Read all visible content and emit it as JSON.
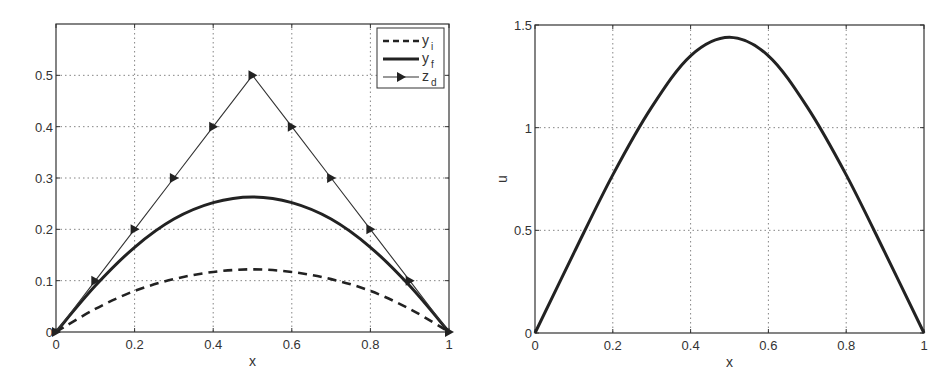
{
  "chart_data": [
    {
      "type": "line",
      "title": "",
      "xlabel": "x",
      "ylabel": "",
      "xlim": [
        0,
        1
      ],
      "ylim": [
        0,
        0.6
      ],
      "xticks": [
        "0",
        "0.2",
        "0.4",
        "0.6",
        "0.8",
        "1"
      ],
      "yticks": [
        "0",
        "0.1",
        "0.2",
        "0.3",
        "0.4",
        "0.5"
      ],
      "grid": true,
      "legend_position": "upper right",
      "series": [
        {
          "name": "y_i",
          "legend_label": "y",
          "legend_sub": "i",
          "style": "dashed",
          "x": [
            0,
            0.1,
            0.2,
            0.3,
            0.4,
            0.5,
            0.6,
            0.7,
            0.8,
            0.9,
            1.0
          ],
          "values": [
            0,
            0.045,
            0.08,
            0.103,
            0.117,
            0.122,
            0.117,
            0.103,
            0.08,
            0.045,
            0
          ]
        },
        {
          "name": "y_f",
          "legend_label": "y",
          "legend_sub": "f",
          "style": "solid-thick",
          "x": [
            0,
            0.1,
            0.2,
            0.3,
            0.4,
            0.5,
            0.6,
            0.7,
            0.8,
            0.9,
            1.0
          ],
          "values": [
            0,
            0.09,
            0.165,
            0.22,
            0.252,
            0.263,
            0.252,
            0.22,
            0.165,
            0.09,
            0
          ]
        },
        {
          "name": "z_d",
          "legend_label": "z",
          "legend_sub": "d",
          "style": "thin-with-triangle-markers",
          "x": [
            0,
            0.1,
            0.2,
            0.3,
            0.4,
            0.5,
            0.6,
            0.7,
            0.8,
            0.9,
            1.0
          ],
          "values": [
            0,
            0.1,
            0.2,
            0.3,
            0.4,
            0.5,
            0.4,
            0.3,
            0.2,
            0.1,
            0
          ]
        }
      ]
    },
    {
      "type": "line",
      "title": "",
      "xlabel": "x",
      "ylabel": "u",
      "xlim": [
        0,
        1
      ],
      "ylim": [
        0,
        1.5
      ],
      "xticks": [
        "0",
        "0.2",
        "0.4",
        "0.6",
        "0.8",
        "1"
      ],
      "yticks": [
        "0",
        "0.5",
        "1",
        "1.5"
      ],
      "grid": true,
      "series": [
        {
          "name": "u",
          "style": "solid-thick",
          "x": [
            0,
            0.1,
            0.2,
            0.3,
            0.4,
            0.5,
            0.6,
            0.7,
            0.8,
            0.9,
            1.0
          ],
          "values": [
            0,
            0.39,
            0.77,
            1.1,
            1.35,
            1.44,
            1.35,
            1.1,
            0.77,
            0.39,
            0
          ]
        }
      ]
    }
  ],
  "colors": {
    "line": "#222222",
    "grid": "#777777",
    "frame": "#333333"
  }
}
